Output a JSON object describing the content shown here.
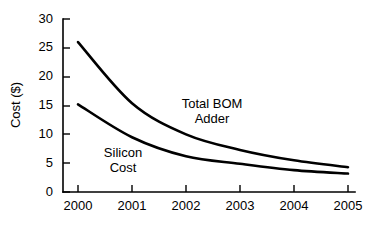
{
  "chart_data": {
    "type": "line",
    "title": "",
    "xlabel": "",
    "ylabel": "Cost ($)",
    "categories": [
      "2000",
      "2001",
      "2002",
      "2003",
      "2004",
      "2005"
    ],
    "x": [
      2000,
      2001,
      2002,
      2003,
      2004,
      2005
    ],
    "xlim": [
      2000,
      2005
    ],
    "ylim": [
      0,
      30
    ],
    "grid": false,
    "legend_position": "inline-annotation",
    "yticks": [
      0,
      5,
      10,
      15,
      20,
      25,
      30
    ],
    "ytick_labels": [
      "0",
      "5",
      "10",
      "15",
      "20",
      "25",
      "30"
    ],
    "xticks": [
      2000,
      2001,
      2002,
      2003,
      2004,
      2005
    ],
    "xtick_labels": [
      "2000",
      "2001",
      "2002",
      "2003",
      "2004",
      "2005"
    ],
    "series": [
      {
        "name": "Total BOM Adder",
        "values": [
          26.0,
          15.4,
          10.0,
          7.3,
          5.5,
          4.3
        ]
      },
      {
        "name": "Silicon Cost",
        "values": [
          15.2,
          9.5,
          6.2,
          4.9,
          3.8,
          3.2
        ]
      }
    ],
    "annotations": [
      {
        "text_line1": "Total BOM",
        "text_line2": "Adder",
        "series": "Total BOM Adder"
      },
      {
        "text_line1": "Silicon",
        "text_line2": "Cost",
        "series": "Silicon Cost"
      }
    ]
  },
  "labels": {
    "y_axis_title": "Cost ($)",
    "ytick_0": "0",
    "ytick_1": "5",
    "ytick_2": "10",
    "ytick_3": "15",
    "ytick_4": "20",
    "ytick_5": "25",
    "ytick_6": "30",
    "xtick_0": "2000",
    "xtick_1": "2001",
    "xtick_2": "2002",
    "xtick_3": "2003",
    "xtick_4": "2004",
    "xtick_5": "2005",
    "bom_label_line1": "Total BOM",
    "bom_label_line2": "Adder",
    "silicon_label_line1": "Silicon",
    "silicon_label_line2": "Cost"
  },
  "colors": {
    "line": "#000000",
    "axis": "#000000",
    "background": "#ffffff"
  }
}
